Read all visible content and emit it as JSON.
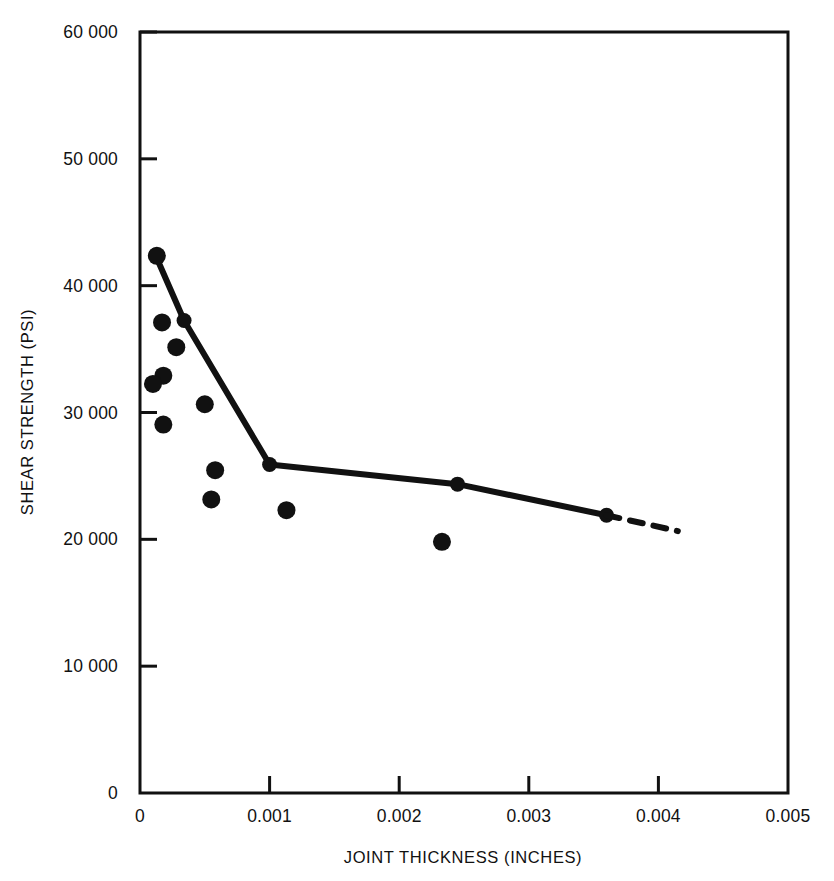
{
  "chart_data": {
    "type": "scatter",
    "title": "",
    "xlabel": "JOINT THICKNESS (INCHES)",
    "ylabel": "SHEAR STRENGTH (PSI)",
    "xlim": [
      0,
      0.005
    ],
    "ylim": [
      0,
      60000
    ],
    "grid": false,
    "legend": "none",
    "x_ticks": [
      0,
      0.001,
      0.002,
      0.003,
      0.004,
      0.005
    ],
    "x_tick_labels": [
      "0",
      "0.001",
      "0.002",
      "0.003",
      "0.004",
      "0.005"
    ],
    "y_ticks": [
      0,
      10000,
      20000,
      30000,
      40000,
      50000,
      60000
    ],
    "y_tick_labels": [
      "0",
      "10 000",
      "20 000",
      "30 000",
      "40 000",
      "50 000",
      "60 000"
    ],
    "series": [
      {
        "name": "Measured data points",
        "type": "scatter",
        "marker": "filled-circle",
        "color": "#111111",
        "points": [
          {
            "x": 0.00013,
            "y": 42350
          },
          {
            "x": 0.00017,
            "y": 37100
          },
          {
            "x": 0.00028,
            "y": 35150
          },
          {
            "x": 0.00018,
            "y": 32900
          },
          {
            "x": 0.0001,
            "y": 32250
          },
          {
            "x": 0.0005,
            "y": 30650
          },
          {
            "x": 0.00018,
            "y": 29050
          },
          {
            "x": 0.00058,
            "y": 25450
          },
          {
            "x": 0.00055,
            "y": 23150
          },
          {
            "x": 0.00113,
            "y": 22300
          },
          {
            "x": 0.00233,
            "y": 19800
          }
        ]
      },
      {
        "name": "Fitted trend (solid)",
        "type": "line",
        "style": "solid",
        "color": "#111111",
        "points": [
          {
            "x": 0.00012,
            "y": 42400
          },
          {
            "x": 0.00034,
            "y": 37250
          },
          {
            "x": 0.001,
            "y": 25900
          },
          {
            "x": 0.00245,
            "y": 24350
          },
          {
            "x": 0.0036,
            "y": 21900
          }
        ]
      },
      {
        "name": "Extrapolated trend (dashed)",
        "type": "line",
        "style": "dashed",
        "color": "#111111",
        "points": [
          {
            "x": 0.0036,
            "y": 21900
          },
          {
            "x": 0.00415,
            "y": 20650
          }
        ]
      }
    ]
  },
  "axes": {
    "x_axis_title": "JOINT THICKNESS (INCHES)",
    "y_axis_title": "SHEAR STRENGTH (PSI)"
  },
  "style": {
    "background": "#ffffff",
    "ink": "#111111"
  }
}
